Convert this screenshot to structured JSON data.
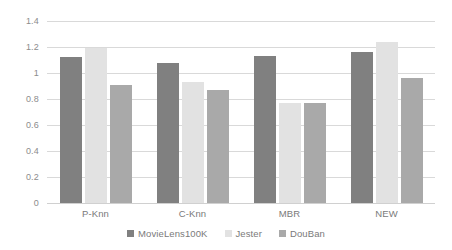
{
  "chart_data": {
    "type": "bar",
    "title": "",
    "subtitle": "",
    "xlabel": "",
    "ylabel": "",
    "categories": [
      "P-Knn",
      "C-Knn",
      "MBR",
      "NEW"
    ],
    "series": [
      {
        "name": "MovieLens100K",
        "color": "#808080",
        "values": [
          1.12,
          1.08,
          1.13,
          1.16
        ]
      },
      {
        "name": "Jester",
        "color": "#e2e2e2",
        "values": [
          1.19,
          0.93,
          0.77,
          1.24
        ]
      },
      {
        "name": "DouBan",
        "color": "#a9a9a9",
        "values": [
          0.91,
          0.87,
          0.77,
          0.96
        ]
      }
    ],
    "ylim": [
      0,
      1.4
    ],
    "ytick_values": [
      0,
      0.2,
      0.4,
      0.6,
      0.8,
      1.0,
      1.2,
      1.4
    ],
    "ytick_labels": [
      "0",
      "0.2",
      "0.4",
      "0.6",
      "0.8",
      "1",
      "1.2",
      "1.4"
    ],
    "grid": true,
    "grid_axis": "y",
    "legend_position": "bottom",
    "background_color": "#ffffff",
    "gridline_color": "#d9d9d9",
    "tick_label_color": "#8c8c8c"
  }
}
